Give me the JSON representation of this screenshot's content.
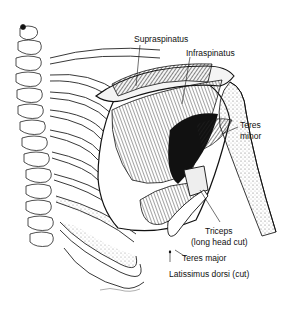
{
  "figure": {
    "labels": [
      {
        "id": "supraspinatus",
        "text": "Supraspinatus"
      },
      {
        "id": "infraspinatus",
        "text": "Infraspinatus"
      },
      {
        "id": "teres_minor_1",
        "text": "Teres"
      },
      {
        "id": "teres_minor_2",
        "text": "minor"
      },
      {
        "id": "triceps_1",
        "text": "Triceps"
      },
      {
        "id": "triceps_2",
        "text": "(long head cut)"
      },
      {
        "id": "teres_major",
        "text": "Teres major"
      },
      {
        "id": "latissimus",
        "text": "Latissimus dorsi (cut)"
      }
    ],
    "colors": {
      "ink": "#111111",
      "background": "#ffffff",
      "shade": "#9a9a9a"
    }
  }
}
